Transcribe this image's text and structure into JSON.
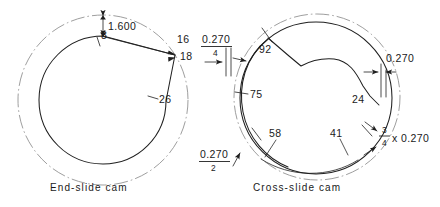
{
  "figure": {
    "background_color": "#ffffff",
    "line_color": "#1f1f1f",
    "centerline_color": "#8d8d8d"
  },
  "end_slide_cam": {
    "caption": "End-slide cam",
    "dimensions": {
      "rise": "1.600"
    },
    "station_labels": [
      {
        "name": "label-8",
        "text": "8"
      },
      {
        "name": "label-16",
        "text": "16"
      },
      {
        "name": "label-18",
        "text": "18"
      },
      {
        "name": "label-26",
        "text": "26"
      }
    ]
  },
  "cross_slide_cam": {
    "caption": "Cross-slide cam",
    "station_labels": [
      {
        "name": "label-92",
        "text": "92"
      },
      {
        "name": "label-75",
        "text": "75"
      },
      {
        "name": "label-58",
        "text": "58"
      },
      {
        "name": "label-41",
        "text": "41"
      },
      {
        "name": "label-24",
        "text": "24"
      }
    ],
    "annotations": [
      {
        "name": "lead-fraction-quarter",
        "numerator": "0.270",
        "denominator": "4",
        "style": "fraction"
      },
      {
        "name": "lead-fraction-half",
        "numerator": "0.270",
        "denominator": "2",
        "style": "fraction"
      },
      {
        "name": "lead-plain",
        "text": "0.270",
        "style": "plain"
      },
      {
        "name": "lead-three-quarter-product",
        "numerator": "3",
        "denominator": "4",
        "multiplier_text": "x 0.270",
        "style": "fraction-product"
      }
    ]
  }
}
